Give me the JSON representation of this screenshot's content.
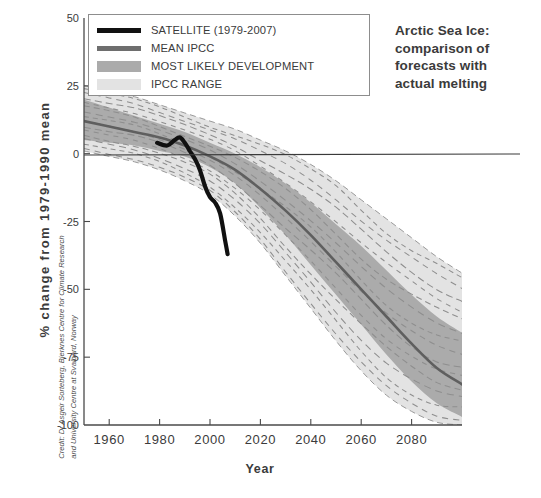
{
  "title": {
    "line1": "Arctic Sea Ice:",
    "line2": "comparison of",
    "line3": "forecasts with",
    "line4": "actual melting",
    "full": "Arctic Sea Ice: comparison of forecasts with actual melting"
  },
  "credit": "Credit: Dr Asgeir Sorteberg, Bjerknes Centre for Climate Research and University Centre at Svalbard, Norway",
  "legend": {
    "items": [
      {
        "label": "SATELLITE (1979-2007)",
        "swatch": "line",
        "color": "#111111"
      },
      {
        "label": "MEAN IPCC",
        "swatch": "line",
        "color": "#6e6e6e"
      },
      {
        "label": "MOST LIKELY DEVELOPMENT",
        "swatch": "band",
        "color": "#ababab"
      },
      {
        "label": "IPCC RANGE",
        "swatch": "band",
        "color": "#e3e3e3"
      }
    ]
  },
  "colors": {
    "satellite": "#111111",
    "mean_ipcc": "#6e6e6e",
    "most_likely_band": "#ababab",
    "ipcc_range_band": "#e3e3e3",
    "model_dashed": "#8e8e8e",
    "axis": "#4a4a4a",
    "background": "#ffffff",
    "text": "#3b3b3b"
  },
  "chart_data": {
    "type": "line",
    "title": "Arctic Sea Ice: comparison of forecasts with actual melting",
    "xlabel": "Year",
    "ylabel": "% change from 1979-1990 mean",
    "xlim": [
      1950,
      2100
    ],
    "ylim": [
      -100,
      50
    ],
    "xticks": [
      1960,
      1980,
      2000,
      2020,
      2040,
      2060,
      2080
    ],
    "yticks": [
      50,
      25,
      0,
      -25,
      -50,
      -75,
      -100
    ],
    "grid": false,
    "legend_position": "top-left",
    "zero_line": 0,
    "series": [
      {
        "name": "SATELLITE (1979-2007)",
        "style": "solid-thick",
        "color": "#111111",
        "x": [
          1979,
          1983,
          1986,
          1988,
          1990,
          1992,
          1994,
          1996,
          1998,
          2000,
          2002,
          2004,
          2006,
          2007
        ],
        "y": [
          4,
          3,
          5,
          6,
          4,
          1,
          -2,
          -6,
          -12,
          -16,
          -18,
          -22,
          -32,
          -37
        ]
      },
      {
        "name": "MEAN IPCC",
        "style": "solid",
        "color": "#6e6e6e",
        "x": [
          1950,
          1960,
          1970,
          1980,
          1990,
          2000,
          2010,
          2020,
          2030,
          2040,
          2050,
          2060,
          2070,
          2080,
          2090,
          2100
        ],
        "y": [
          12,
          10,
          8,
          6,
          3,
          -1,
          -6,
          -13,
          -21,
          -30,
          -40,
          -50,
          -60,
          -70,
          -79,
          -85
        ]
      },
      {
        "name": "MOST LIKELY DEVELOPMENT upper",
        "style": "band-edge",
        "color": "#ababab",
        "x": [
          1950,
          1960,
          1970,
          1980,
          1990,
          2000,
          2010,
          2020,
          2030,
          2040,
          2050,
          2060,
          2070,
          2080,
          2090,
          2100
        ],
        "y": [
          20,
          17,
          14,
          11,
          8,
          4,
          0,
          -5,
          -11,
          -18,
          -26,
          -34,
          -43,
          -52,
          -60,
          -66
        ]
      },
      {
        "name": "MOST LIKELY DEVELOPMENT lower",
        "style": "band-edge",
        "color": "#ababab",
        "x": [
          1950,
          1960,
          1970,
          1980,
          1990,
          2000,
          2010,
          2020,
          2030,
          2040,
          2050,
          2060,
          2070,
          2080,
          2090,
          2100
        ],
        "y": [
          5,
          4,
          3,
          1,
          -1,
          -5,
          -11,
          -20,
          -30,
          -41,
          -52,
          -63,
          -74,
          -84,
          -92,
          -97
        ]
      },
      {
        "name": "IPCC RANGE upper",
        "style": "band-edge",
        "color": "#e3e3e3",
        "x": [
          1950,
          1960,
          1970,
          1980,
          1990,
          2000,
          2010,
          2020,
          2030,
          2040,
          2050,
          2060,
          2070,
          2080,
          2090,
          2100
        ],
        "y": [
          25,
          23,
          21,
          18,
          15,
          12,
          9,
          5,
          1,
          -4,
          -10,
          -17,
          -24,
          -31,
          -38,
          -44
        ]
      },
      {
        "name": "IPCC RANGE lower",
        "style": "band-edge",
        "color": "#e3e3e3",
        "x": [
          1950,
          1960,
          1970,
          1980,
          1990,
          2000,
          2010,
          2020,
          2030,
          2040,
          2050,
          2060,
          2070,
          2080,
          2090,
          2100
        ],
        "y": [
          1,
          -1,
          -3,
          -6,
          -10,
          -15,
          -23,
          -33,
          -45,
          -57,
          -69,
          -80,
          -89,
          -95,
          -99,
          -100
        ]
      }
    ],
    "model_runs_note": "Individual IPCC model projections shown as dashed grey lines spanning the IPCC range",
    "model_runs_count": 14
  },
  "axes": {
    "x_tick_labels": [
      "1960",
      "1980",
      "2000",
      "2020",
      "2040",
      "2060",
      "2080"
    ],
    "y_tick_labels": [
      "50",
      "25",
      "0",
      "-25",
      "-50",
      "-75",
      "-100"
    ]
  }
}
